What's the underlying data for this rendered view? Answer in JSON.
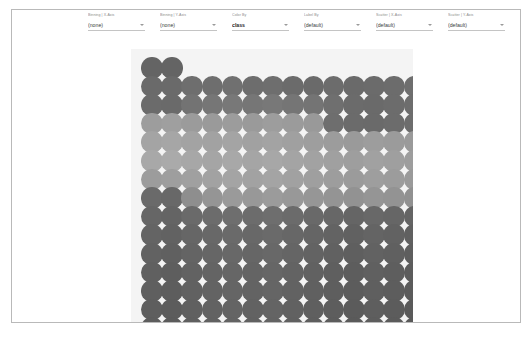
{
  "window": {
    "background": "#ffffff",
    "card_border": "#b9b9b9"
  },
  "toolbar": {
    "fields": [
      {
        "label": "Binning | X-Axis",
        "value": "(none)",
        "name": "binning-x-axis"
      },
      {
        "label": "Binning | Y-Axis",
        "value": "(none)",
        "name": "binning-y-axis"
      },
      {
        "label": "Color By",
        "value": "class",
        "name": "color-by"
      },
      {
        "label": "Label By",
        "value": "(default)",
        "name": "label-by"
      },
      {
        "label": "Scatter | X-Axis",
        "value": "(default)",
        "name": "scatter-x-axis"
      },
      {
        "label": "Scatter | Y-Axis",
        "value": "(default)",
        "name": "scatter-y-axis"
      }
    ]
  },
  "chart_data": {
    "type": "scatter",
    "title": "",
    "xlabel": "",
    "ylabel": "",
    "grid": false,
    "legend": false,
    "plot_background": "#f4f4f4",
    "marker": {
      "shape": "circle",
      "diameter_px": 21.5,
      "spacing_x_px": 20.2,
      "spacing_y_px": 18.6
    },
    "columns": 14,
    "rows": 20,
    "colors_used": [
      "#5d5d5d",
      "#666666",
      "#6f6f6f",
      "#7c7c7c",
      "#8d8d8d",
      "#9a9a9a",
      "#a6a6a6",
      "#b0b0b0"
    ],
    "note": "Grayscale colour encodes the 'class' field; rows are packed top-to-bottom, first row partially filled with 2 points, last row with 13 points.",
    "points_per_row": [
      2,
      14,
      14,
      14,
      14,
      14,
      14,
      14,
      14,
      14,
      14,
      14,
      14,
      14,
      14,
      14,
      14,
      14,
      14,
      13
    ],
    "row_colors": [
      [
        "#646464",
        "#646464"
      ],
      [
        "#6a6a6a",
        "#6a6a6a",
        "#6e6e6e",
        "#6e6e6e",
        "#707070",
        "#6d6d6d",
        "#6e6e6e",
        "#6b6b6b",
        "#6a6a6a",
        "#6c6c6c",
        "#6a6a6a",
        "#6b6b6b",
        "#6c6c6c",
        "#6e6e6e"
      ],
      [
        "#6b6b6b",
        "#6a6a6a",
        "#737373",
        "#767676",
        "#787878",
        "#767676",
        "#787878",
        "#757575",
        "#747474",
        "#6f6f6f",
        "#6b6b6b",
        "#6a6a6a",
        "#6c6c6c",
        "#6d6d6d"
      ],
      [
        "#9d9d9d",
        "#9f9f9f",
        "#9b9b9b",
        "#9a9a9a",
        "#9c9c9c",
        "#9a9a9a",
        "#9d9d9d",
        "#9b9b9b",
        "#999999",
        "#6e6e6e",
        "#6b6b6b",
        "#6a6a6a",
        "#6c6c6c",
        "#6d6d6d"
      ],
      [
        "#a4a4a4",
        "#a6a6a6",
        "#a3a3a3",
        "#a2a2a2",
        "#a4a4a4",
        "#a1a1a1",
        "#a3a3a3",
        "#a0a0a0",
        "#9e9e9e",
        "#9c9c9c",
        "#9a9a9a",
        "#9d9d9d",
        "#9b9b9b",
        "#9a9a9a"
      ],
      [
        "#a8a8a8",
        "#aaaaaa",
        "#a7a7a7",
        "#a5a5a5",
        "#a8a8a8",
        "#a5a5a5",
        "#a7a7a7",
        "#a4a4a4",
        "#a2a2a2",
        "#a0a0a0",
        "#9e9e9e",
        "#a1a1a1",
        "#9f9f9f",
        "#9d9d9d"
      ],
      [
        "#9c9c9c",
        "#9e9e9e",
        "#a0a0a0",
        "#a2a2a2",
        "#a4a4a4",
        "#a2a2a2",
        "#a4a4a4",
        "#a1a1a1",
        "#9f9f9f",
        "#9d9d9d",
        "#9b9b9b",
        "#9e9e9e",
        "#9c9c9c",
        "#9a9a9a"
      ],
      [
        "#6a6a6a",
        "#686868",
        "#8e8e8e",
        "#959595",
        "#9a9a9a",
        "#989898",
        "#9b9b9b",
        "#989898",
        "#969696",
        "#949494",
        "#929292",
        "#959595",
        "#939393",
        "#919191"
      ],
      [
        "#666666",
        "#646464",
        "#6a6a6a",
        "#6c6c6c",
        "#6e6e6e",
        "#6c6c6c",
        "#6e6e6e",
        "#6b6b6b",
        "#696969",
        "#676767",
        "#656565",
        "#686868",
        "#666666",
        "#646464"
      ],
      [
        "#646464",
        "#626262",
        "#666666",
        "#686868",
        "#6a6a6a",
        "#686868",
        "#6a6a6a",
        "#676767",
        "#656565",
        "#636363",
        "#616161",
        "#646464",
        "#626262",
        "#606060"
      ],
      [
        "#626262",
        "#606060",
        "#646464",
        "#666666",
        "#686868",
        "#666666",
        "#686868",
        "#656565",
        "#636363",
        "#616161",
        "#5f5f5f",
        "#626262",
        "#606060",
        "#5e5e5e"
      ],
      [
        "#606060",
        "#5e5e5e",
        "#626262",
        "#646464",
        "#666666",
        "#646464",
        "#666666",
        "#636363",
        "#616161",
        "#5f5f5f",
        "#5d5d5d",
        "#606060",
        "#5e5e5e",
        "#5c5c5c"
      ],
      [
        "#5f5f5f",
        "#5d5d5d",
        "#616161",
        "#636363",
        "#656565",
        "#636363",
        "#656565",
        "#626262",
        "#606060",
        "#5e5e5e",
        "#5c5c5c",
        "#5f5f5f",
        "#5d5d5d",
        "#5b5b5b"
      ],
      [
        "#5e5e5e",
        "#5c5c5c",
        "#606060",
        "#626262",
        "#646464",
        "#626262",
        "#646464",
        "#616161",
        "#5f5f5f",
        "#5d5d5d",
        "#5b5b5b",
        "#5e5e5e",
        "#5c5c5c",
        "#5a5a5a"
      ],
      [
        "#5d5d5d",
        "#5b5b5b",
        "#5f5f5f",
        "#616161",
        "#636363",
        "#616161",
        "#636363",
        "#606060",
        "#5e5e5e",
        "#5c5c5c",
        "#5a5a5a",
        "#5d5d5d",
        "#5b5b5b",
        "#595959"
      ],
      [
        "#5d5d5d",
        "#5b5b5b",
        "#5f5f5f",
        "#616161",
        "#636363",
        "#616161",
        "#636363",
        "#606060",
        "#5e5e5e",
        "#5c5c5c",
        "#5a5a5a",
        "#5d5d5d",
        "#5b5b5b",
        "#595959"
      ],
      [
        "#5c5c5c",
        "#5a5a5a",
        "#5e5e5e",
        "#606060",
        "#626262",
        "#606060",
        "#626262",
        "#5f5f5f",
        "#5d5d5d",
        "#5b5b5b",
        "#595959",
        "#5c5c5c",
        "#5a5a5a",
        "#585858"
      ],
      [
        "#5c5c5c",
        "#5a5a5a",
        "#5e5e5e",
        "#606060",
        "#626262",
        "#606060",
        "#626262",
        "#5f5f5f",
        "#5d5d5d",
        "#5b5b5b",
        "#595959",
        "#5c5c5c",
        "#5a5a5a",
        "#585858"
      ],
      [
        "#5b5b5b",
        "#595959",
        "#5d5d5d",
        "#5f5f5f",
        "#616161",
        "#5f5f5f",
        "#616161",
        "#5e5e5e",
        "#5c5c5c",
        "#5a5a5a",
        "#585858",
        "#5b5b5b",
        "#595959",
        "#575757"
      ],
      [
        "#5b5b5b",
        "#595959",
        "#5d5d5d",
        "#5f5f5f",
        "#616161",
        "#5f5f5f",
        "#616161",
        "#5e5e5e",
        "#5c5c5c",
        "#5a5a5a",
        "#585858",
        "#5b5b5b",
        "#595959"
      ]
    ]
  }
}
